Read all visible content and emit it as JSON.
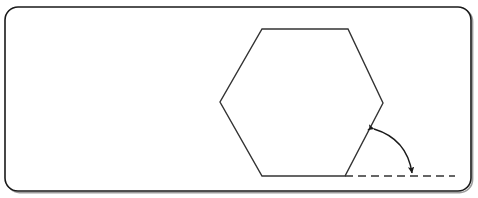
{
  "figure": {
    "title": "Regular hexagon with exterior angle arc",
    "background_color": "#ffffff",
    "frame": {
      "name": "rounded-rectangle-frame",
      "x": 5,
      "y": 7,
      "width": 466,
      "height": 184,
      "corner_radius": 13,
      "stroke_color": "#1a1a1a",
      "stroke_width": 1.6,
      "fill": "#ffffff",
      "shadow_color": "#4d4d4d"
    }
  },
  "chart_data": {
    "type": "diagram",
    "title": "Regular hexagon with exterior angle arc",
    "xlabel": "",
    "ylabel": "",
    "grid": false,
    "legend": null,
    "shapes": [
      {
        "name": "hexagon",
        "type": "polygon",
        "sides": 6,
        "stroke_color": "#333333",
        "stroke_width": 1.4,
        "fill": "none",
        "vertices": [
          {
            "label": "top-left",
            "x": 262,
            "y": 29
          },
          {
            "label": "top-right",
            "x": 348,
            "y": 29
          },
          {
            "label": "right",
            "x": 383,
            "y": 103
          },
          {
            "label": "bottom-right",
            "x": 345,
            "y": 176
          },
          {
            "label": "bottom-left",
            "x": 262,
            "y": 176
          },
          {
            "label": "left",
            "x": 220,
            "y": 102
          }
        ]
      },
      {
        "name": "dashed-baseline",
        "type": "line",
        "style": "dashed",
        "dash_pattern": [
          8,
          5
        ],
        "stroke_color": "#333333",
        "stroke_width": 1.6,
        "x1": 345,
        "y1": 176,
        "x2": 455,
        "y2": 176
      },
      {
        "name": "angle-arc",
        "type": "arc",
        "stroke_color": "#1a1a1a",
        "stroke_width": 1.4,
        "fill": "none",
        "start": {
          "x": 374,
          "y": 129
        },
        "end": {
          "x": 412,
          "y": 175
        },
        "control": {
          "x": 407,
          "y": 139
        },
        "arrowheads": [
          "start",
          "end"
        ],
        "start_arrow_direction": "up-left",
        "end_arrow_direction": "down"
      }
    ],
    "annotations": []
  }
}
